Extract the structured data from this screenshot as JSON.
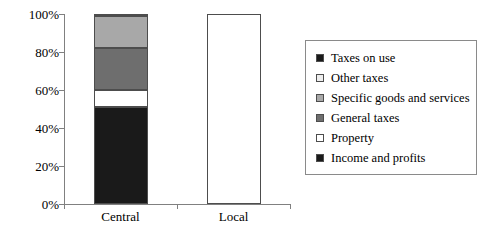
{
  "chart_data": {
    "type": "bar",
    "subtype": "stacked-100-percent",
    "title": "",
    "xlabel": "",
    "ylabel": "",
    "categories": [
      "Central",
      "Local"
    ],
    "ylim": [
      0,
      100
    ],
    "ytick_labels": [
      "0%",
      "20%",
      "40%",
      "60%",
      "80%",
      "100%"
    ],
    "ytick_values": [
      0,
      20,
      40,
      60,
      80,
      100
    ],
    "grid": false,
    "legend_position": "right",
    "series": [
      {
        "name": "Income and profits",
        "color": "#1a1a1a",
        "values": [
          51,
          0
        ]
      },
      {
        "name": "Property",
        "color": "#ffffff",
        "values": [
          9,
          100
        ]
      },
      {
        "name": "General taxes",
        "color": "#6e6e6e",
        "values": [
          22,
          0
        ]
      },
      {
        "name": "Specific goods and services",
        "color": "#a8a8a8",
        "values": [
          17,
          0
        ]
      },
      {
        "name": "Other taxes",
        "color": "#ededed",
        "values": [
          0.5,
          0
        ]
      },
      {
        "name": "Taxes on use",
        "color": "#1a1a1a",
        "values": [
          0.5,
          0
        ]
      }
    ],
    "legend_entries": [
      {
        "label": "Taxes on use",
        "color": "#1a1a1a"
      },
      {
        "label": "Other taxes",
        "color": "#ededed"
      },
      {
        "label": "Specific goods and services",
        "color": "#a8a8a8"
      },
      {
        "label": "General taxes",
        "color": "#6e6e6e"
      },
      {
        "label": "Property",
        "color": "#ffffff"
      },
      {
        "label": "Income and profits",
        "color": "#1a1a1a"
      }
    ],
    "axis_color": "#808080",
    "segment_border_color": "#4d4d4d"
  }
}
